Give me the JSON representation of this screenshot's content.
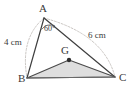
{
  "figure": {
    "background_color": "#ffffff",
    "stroke_color": "#3a3a3a",
    "dashed_arc_color": "#b9b3b0",
    "inner_fill_color": "#dcdcdc",
    "vertices": {
      "A": {
        "label": "A",
        "x": 44,
        "y": 18
      },
      "B": {
        "label": "B",
        "x": 27,
        "y": 78
      },
      "C": {
        "label": "C",
        "x": 115,
        "y": 77
      },
      "G": {
        "label": "G",
        "x": 69,
        "y": 60
      }
    },
    "measures": {
      "side_ab": "4 cm",
      "side_ac": "6 cm",
      "angle_a": "60°"
    },
    "outer_triangle": "A-B-C",
    "inner_triangle": "B-G-C",
    "construction_arcs": [
      {
        "name": "arc-a-to-b",
        "from": "A",
        "to": "B",
        "style": "dashed"
      },
      {
        "name": "arc-a-to-c",
        "from": "A",
        "to": "C",
        "style": "dashed"
      }
    ]
  }
}
